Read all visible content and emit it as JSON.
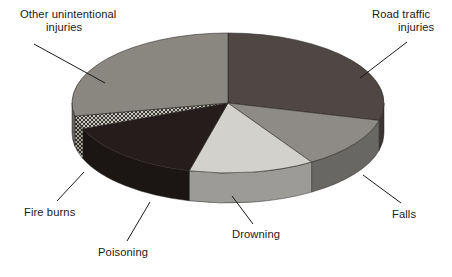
{
  "chart_data": {
    "type": "pie",
    "title": "",
    "subtitle": "",
    "xlabel": "",
    "ylabel": "",
    "legend_position": "callout-labels",
    "grid": false,
    "style": "3d-exploded-grayscale",
    "start_angle_deg": 0,
    "direction": "clockwise",
    "categories": [
      "Road traffic injuries",
      "Falls",
      "Drowning",
      "Poisoning",
      "Fire burns",
      "Other unintentional injuries"
    ],
    "values": [
      29,
      12,
      13,
      15,
      3,
      28
    ],
    "units": "percent",
    "slices": [
      {
        "label": "Road traffic injuries",
        "value": 29,
        "start_deg": 0,
        "end_deg": 104.4,
        "color": "#4f4744",
        "pattern": "solid"
      },
      {
        "label": "Falls",
        "value": 12,
        "start_deg": 104.4,
        "end_deg": 147.6,
        "color": "#8e8b86",
        "pattern": "solid"
      },
      {
        "label": "Drowning",
        "value": 13,
        "start_deg": 147.6,
        "end_deg": 194.4,
        "color": "#d3d1cc",
        "pattern": "solid"
      },
      {
        "label": "Poisoning",
        "value": 15,
        "start_deg": 194.4,
        "end_deg": 248.4,
        "color": "#241d1b",
        "pattern": "solid"
      },
      {
        "label": "Fire burns",
        "value": 3,
        "start_deg": 248.4,
        "end_deg": 259.2,
        "color": "#9a978f",
        "pattern": "crosshatch"
      },
      {
        "label": "Other unintentional injuries",
        "value": 28,
        "start_deg": 259.2,
        "end_deg": 360,
        "color": "#8a8780",
        "pattern": "solid"
      }
    ],
    "callouts": [
      {
        "id": "other-unintentional-injuries",
        "line1": "Other unintentional",
        "line2": "injuries",
        "text_x": 20,
        "text_y": 18,
        "anchor": "start",
        "leader": [
          [
            34,
            44
          ],
          [
            105,
            83
          ]
        ]
      },
      {
        "id": "road-traffic-injuries",
        "line1": "Road traffic",
        "line2": "injuries",
        "text_x": 372,
        "text_y": 18,
        "anchor": "start",
        "leader": [
          [
            407,
            42
          ],
          [
            360,
            78
          ]
        ]
      },
      {
        "id": "falls",
        "line1": "Falls",
        "line2": "",
        "text_x": 392,
        "text_y": 218,
        "anchor": "start",
        "leader": [
          [
            401,
            203
          ],
          [
            363,
            175
          ]
        ]
      },
      {
        "id": "drowning",
        "line1": "Drowning",
        "line2": "",
        "text_x": 232,
        "text_y": 238,
        "anchor": "start",
        "leader": [
          [
            253,
            224
          ],
          [
            232,
            196
          ]
        ]
      },
      {
        "id": "poisoning",
        "line1": "Poisoning",
        "line2": "",
        "text_x": 98,
        "text_y": 256,
        "anchor": "start",
        "leader": [
          [
            127,
            241
          ],
          [
            150,
            202
          ]
        ]
      },
      {
        "id": "fire-burns",
        "line1": "Fire burns",
        "line2": "",
        "text_x": 24,
        "text_y": 216,
        "anchor": "start",
        "leader": [
          [
            57,
            201
          ],
          [
            84,
            172
          ]
        ]
      }
    ],
    "geometry": {
      "cx": 228,
      "cy": 103,
      "rx": 156,
      "ry": 70,
      "depth": 30
    },
    "colors": {
      "background": "#ffffff",
      "text": "#1a1a1a",
      "leader": "#1a1a1a"
    }
  }
}
